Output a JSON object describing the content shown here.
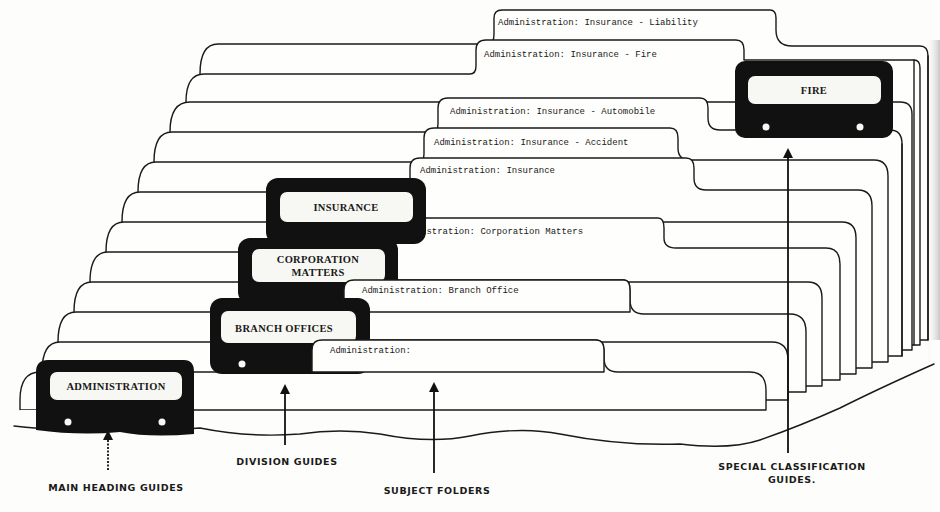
{
  "diagram": {
    "type": "filing-system-illustration",
    "folder_tabs": [
      {
        "id": "liability",
        "label": "Administration:  Insurance - Liability"
      },
      {
        "id": "fire",
        "label": "Administration:  Insurance - Fire"
      },
      {
        "id": "automobile",
        "label": "Administration:  Insurance - Automobile"
      },
      {
        "id": "accident",
        "label": "Administration:  Insurance - Accident"
      },
      {
        "id": "insurance",
        "label": "Administration:  Insurance"
      },
      {
        "id": "corporation",
        "label": "Administration:  Corporation Matters"
      },
      {
        "id": "branch",
        "label": "Administration:  Branch Office"
      },
      {
        "id": "admin",
        "label": "Administration:"
      }
    ],
    "guides": {
      "fire": {
        "label": "FIRE"
      },
      "insurance": {
        "label": "INSURANCE"
      },
      "corporation": {
        "line1": "CORPORATION",
        "line2": "MATTERS"
      },
      "branch": {
        "label": "BRANCH OFFICES"
      },
      "administration": {
        "label": "ADMINISTRATION"
      }
    },
    "captions": {
      "main_heading": "MAIN HEADING GUIDES",
      "division": "DIVISION GUIDES",
      "subject": "SUBJECT FOLDERS",
      "special_line1": "SPECIAL CLASSIFICATION",
      "special_line2": "GUIDES."
    },
    "colors": {
      "ink": "#1a1a1a",
      "paper": "#fdfdfb",
      "guide_fill": "#111111"
    }
  }
}
